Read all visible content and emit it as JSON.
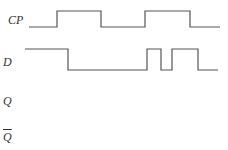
{
  "diagram": {
    "type": "timing-diagram",
    "signals": [
      {
        "id": "cp",
        "label": "CP",
        "overline": false,
        "label_pos": {
          "x": 8,
          "y": 14
        },
        "stroke": "#555555",
        "points": "29,27 57,27 57,11 101,11 101,27 145,27 145,11 190,11 190,27 220,27"
      },
      {
        "id": "d",
        "label": "D",
        "overline": false,
        "label_pos": {
          "x": 3,
          "y": 56
        },
        "stroke": "#555555",
        "points": "25,49 68,49 68,70 147,70 147,49 161,49 161,70 172,70 172,49 198,49 198,70 218,70"
      },
      {
        "id": "q",
        "label": "Q",
        "overline": false,
        "label_pos": {
          "x": 3,
          "y": 95
        },
        "stroke": "#555555",
        "points": ""
      },
      {
        "id": "qbar",
        "label": "Q",
        "overline": true,
        "label_pos": {
          "x": 3,
          "y": 131
        },
        "stroke": "#555555",
        "points": ""
      }
    ]
  }
}
